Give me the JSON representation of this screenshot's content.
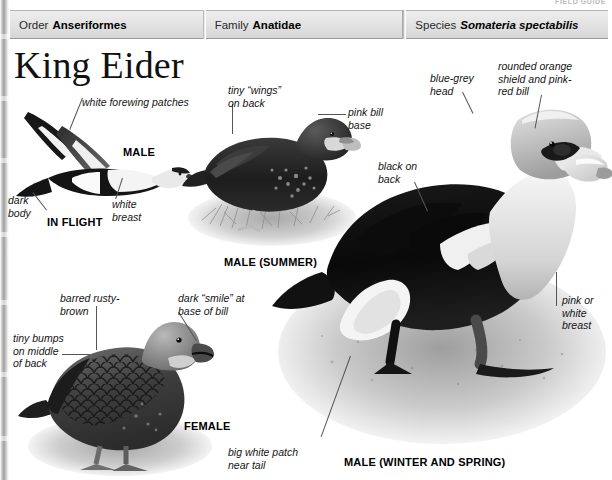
{
  "page": {
    "cropped_header_text": "FIELD GUIDE",
    "title": "King Eider"
  },
  "taxonomy": {
    "columns": [
      {
        "key": "Order",
        "value": "Anseriformes",
        "italic": false
      },
      {
        "key": "Family",
        "value": "Anatidae",
        "italic": false
      },
      {
        "key": "Species",
        "value": "Somateria spectabilis",
        "italic": true
      }
    ]
  },
  "figures": {
    "in_flight": {
      "caption": "IN FLIGHT",
      "sex_caption": "MALE",
      "labels": {
        "forewing": "white forewing patches",
        "dark_body": "dark\nbody",
        "white_breast": "white\nbreast"
      }
    },
    "male_summer": {
      "caption": "MALE (SUMMER)",
      "labels": {
        "tiny_wings": "tiny “wings”\non back",
        "pink_bill": "pink bill\nbase"
      }
    },
    "male_winter": {
      "caption": "MALE (WINTER AND SPRING)",
      "labels": {
        "blue_grey_head": "blue-grey\nhead",
        "shield_bill": "rounded orange\nshield and pink-\nred bill",
        "black_on_back": "black on\nback",
        "pink_white_breast": "pink or\nwhite\nbreast",
        "white_patch": "big white patch\nnear tail"
      }
    },
    "female": {
      "caption": "FEMALE",
      "labels": {
        "barred": "barred rusty-\nbrown",
        "dark_smile": "dark “smile” at\nbase of bill",
        "tiny_bumps": "tiny bumps\non middle\nof back"
      }
    }
  },
  "colors": {
    "header_bg": "#e3e3e3",
    "header_border": "#9a9a9a",
    "text": "#151515",
    "leader_line": "#555555",
    "page_bg": "#ffffff"
  }
}
